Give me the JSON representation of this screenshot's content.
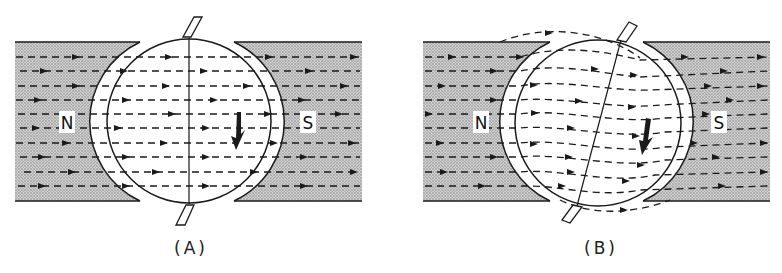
{
  "figure": {
    "panels": [
      {
        "id": "A",
        "caption": "(A)",
        "left_pole_label": "N",
        "right_pole_label": "S",
        "description": "Armature with axis aligned vertically; uniform horizontal field lines through armature",
        "rotation_arrow": "clockwise"
      },
      {
        "id": "B",
        "caption": "(B)",
        "left_pole_label": "N",
        "right_pole_label": "S",
        "description": "Armature rotated; field lines distorted (bent) through armature due to armature reaction",
        "rotation_arrow": "clockwise"
      }
    ],
    "colors": {
      "pole_fill": "#bdbdbd",
      "line": "#1a1a1a",
      "background": "#ffffff"
    }
  }
}
